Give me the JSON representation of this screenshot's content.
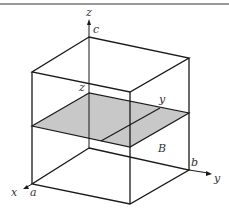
{
  "figure": {
    "labels": {
      "z_axis": "z",
      "c": "c",
      "z_level": "z",
      "y_level": "y",
      "region": "B",
      "b": "b",
      "y_axis": "y",
      "x_axis": "x",
      "a": "a"
    },
    "colors": {
      "line": "#1a1a1a",
      "plane_fill": "#c8c8c8",
      "rule": "#777777",
      "label": "#333333"
    }
  }
}
